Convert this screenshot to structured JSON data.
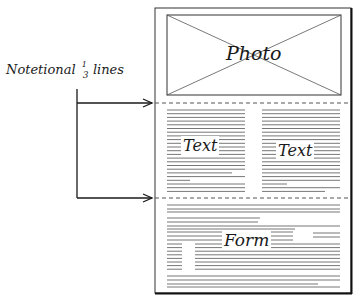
{
  "annotation": {
    "label_prefix": "Notetional",
    "fraction_num": "1",
    "fraction_den": "3",
    "label_suffix": "lines"
  },
  "page": {
    "photo_label": "Photo",
    "text_left_label": "Text",
    "text_right_label": "Text",
    "form_label": "Form"
  },
  "colors": {
    "ink": "#1a1a1a",
    "text_lines": "#6e6e6e",
    "dash": "#555555"
  }
}
